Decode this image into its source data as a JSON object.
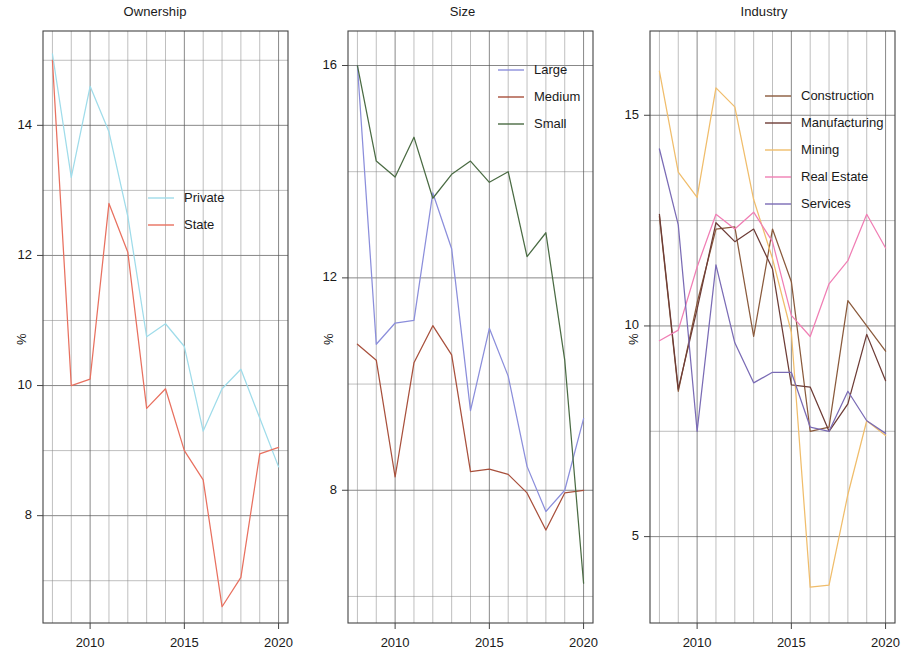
{
  "figure": {
    "width": 913,
    "height": 662,
    "background": "#ffffff"
  },
  "panels": [
    {
      "key": "ownership",
      "title": "Ownership",
      "ylabel": "%",
      "x_ticks": [
        "2010",
        "2015",
        "2020"
      ],
      "y_ticks": [
        "8",
        "10",
        "12",
        "14"
      ],
      "legend": [
        {
          "label": "Private",
          "color": "#9fdcea"
        },
        {
          "label": "State",
          "color": "#e8705f"
        }
      ]
    },
    {
      "key": "size",
      "title": "Size",
      "ylabel": "%",
      "x_ticks": [
        "2010",
        "2015",
        "2020"
      ],
      "y_ticks": [
        "8",
        "12",
        "16"
      ],
      "legend": [
        {
          "label": "Large",
          "color": "#8b8edb"
        },
        {
          "label": "Medium",
          "color": "#a8503c"
        },
        {
          "label": "Small",
          "color": "#4a6b43"
        }
      ]
    },
    {
      "key": "industry",
      "title": "Industry",
      "ylabel": "%",
      "x_ticks": [
        "2010",
        "2015",
        "2020"
      ],
      "y_ticks": [
        "5",
        "10",
        "15"
      ],
      "legend": [
        {
          "label": "Construction",
          "color": "#8a5a3c"
        },
        {
          "label": "Manufacturing",
          "color": "#6d3c36"
        },
        {
          "label": "Mining",
          "color": "#f0bd6b"
        },
        {
          "label": "Real Estate",
          "color": "#f07eb4"
        },
        {
          "label": "Services",
          "color": "#7a6bb5"
        }
      ]
    }
  ],
  "chart_data": [
    {
      "type": "line",
      "title": "Ownership",
      "xlabel": "",
      "ylabel": "%",
      "x": [
        2008,
        2009,
        2010,
        2011,
        2012,
        2013,
        2014,
        2015,
        2016,
        2017,
        2018,
        2019,
        2020
      ],
      "xlim": [
        2007.5,
        2020.5
      ],
      "ylim": [
        6.35,
        15.45
      ],
      "xticks": [
        2010,
        2015,
        2020
      ],
      "yticks": [
        8,
        10,
        12,
        14
      ],
      "grid": true,
      "legend_position": "center",
      "series": [
        {
          "name": "Private",
          "color": "#9fdcea",
          "values": [
            15.1,
            13.2,
            14.6,
            13.9,
            12.6,
            10.75,
            10.95,
            10.6,
            9.3,
            9.95,
            10.25,
            9.5,
            8.75
          ]
        },
        {
          "name": "State",
          "color": "#e8705f",
          "values": [
            15.0,
            10.0,
            10.1,
            12.8,
            12.05,
            9.65,
            9.95,
            9.0,
            8.55,
            6.6,
            7.05,
            8.95,
            9.05
          ]
        }
      ]
    },
    {
      "type": "line",
      "title": "Size",
      "xlabel": "",
      "ylabel": "%",
      "x": [
        2008,
        2009,
        2010,
        2011,
        2012,
        2013,
        2014,
        2015,
        2016,
        2017,
        2018,
        2019,
        2020
      ],
      "xlim": [
        2007.5,
        2020.5
      ],
      "ylim": [
        5.5,
        16.65
      ],
      "xticks": [
        2010,
        2015,
        2020
      ],
      "yticks": [
        8,
        12,
        16
      ],
      "grid": true,
      "legend_position": "upper right",
      "series": [
        {
          "name": "Large",
          "color": "#8b8edb",
          "values": [
            16.0,
            10.75,
            11.15,
            11.2,
            13.6,
            12.55,
            9.5,
            11.05,
            10.15,
            8.45,
            7.6,
            8.0,
            9.35
          ]
        },
        {
          "name": "Medium",
          "color": "#a8503c",
          "values": [
            10.75,
            10.45,
            8.25,
            10.4,
            11.1,
            10.55,
            8.35,
            8.4,
            8.3,
            7.95,
            7.25,
            7.95,
            8.0
          ]
        },
        {
          "name": "Small",
          "color": "#4a6b43",
          "values": [
            16.0,
            14.2,
            13.9,
            14.65,
            13.5,
            13.95,
            14.2,
            13.8,
            14.0,
            12.4,
            12.85,
            10.45,
            6.25
          ]
        }
      ]
    },
    {
      "type": "line",
      "title": "Industry",
      "xlabel": "",
      "ylabel": "%",
      "x": [
        2008,
        2009,
        2010,
        2011,
        2012,
        2013,
        2014,
        2015,
        2016,
        2017,
        2018,
        2019,
        2020
      ],
      "xlim": [
        2007.5,
        2020.5
      ],
      "ylim": [
        2.95,
        17.0
      ],
      "xticks": [
        2010,
        2015,
        2020
      ],
      "yticks": [
        5,
        10,
        15
      ],
      "grid": true,
      "legend_position": "upper right",
      "series": [
        {
          "name": "Construction",
          "color": "#8a5a3c",
          "values": [
            12.6,
            8.45,
            10.55,
            12.3,
            12.35,
            9.75,
            12.3,
            11.05,
            7.5,
            7.6,
            10.6,
            10.0,
            9.4
          ]
        },
        {
          "name": "Manufacturing",
          "color": "#6d3c36",
          "values": [
            12.65,
            8.5,
            10.4,
            12.45,
            12.0,
            12.3,
            11.35,
            8.6,
            8.55,
            7.5,
            8.15,
            9.8,
            8.7
          ]
        },
        {
          "name": "Mining",
          "color": "#f0bd6b",
          "values": [
            16.05,
            13.65,
            13.05,
            15.65,
            15.2,
            13.0,
            11.6,
            9.85,
            3.8,
            3.85,
            6.0,
            7.75,
            7.4
          ]
        },
        {
          "name": "Real Estate",
          "color": "#f07eb4",
          "values": [
            9.65,
            9.9,
            11.4,
            12.65,
            12.3,
            12.7,
            12.0,
            10.25,
            9.75,
            11.0,
            11.55,
            12.65,
            11.85
          ]
        },
        {
          "name": "Services",
          "color": "#7a6bb5",
          "values": [
            14.2,
            12.4,
            7.5,
            11.45,
            9.6,
            8.65,
            8.9,
            8.9,
            7.6,
            7.5,
            8.45,
            7.75,
            7.45
          ]
        }
      ]
    }
  ]
}
